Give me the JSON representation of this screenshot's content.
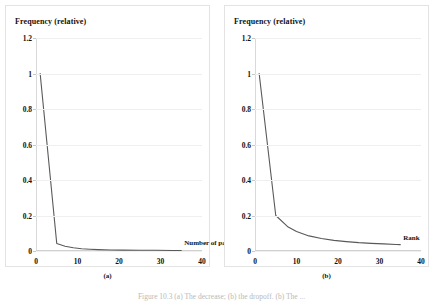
{
  "figure": {
    "caption": "Figure 10.3 (a) The decrease; (b) the dropoff. (b) The ...",
    "subcaption_a": "(a)",
    "subcaption_b": "(b)"
  },
  "chart_data": [
    {
      "type": "line",
      "panel": "a",
      "title": "Frequency (relative)",
      "xlabel": "Number of papers",
      "ylabel": "",
      "xlim": [
        0,
        40
      ],
      "ylim": [
        0,
        1.2
      ],
      "grid": true,
      "legend": "none",
      "xticks": [
        "0",
        "10",
        "20",
        "30",
        "40"
      ],
      "xtick_values": [
        0,
        10,
        20,
        30,
        40
      ],
      "yticks": [
        "0",
        "0.2",
        "0.4",
        "0.6",
        "0.8",
        "1",
        "1.2"
      ],
      "ytick_values": [
        0,
        0.2,
        0.4,
        0.6,
        0.8,
        1,
        1.2
      ],
      "x": [
        1,
        5,
        7,
        9,
        11,
        13,
        15,
        18,
        21,
        25,
        29,
        33,
        35
      ],
      "values": [
        1.0,
        0.042,
        0.027,
        0.018,
        0.013,
        0.01,
        0.008,
        0.006,
        0.005,
        0.004,
        0.004,
        0.003,
        0.003
      ],
      "line_color": "#595959"
    },
    {
      "type": "line",
      "panel": "b",
      "title": "Frequency (relative)",
      "xlabel": "Rank",
      "ylabel": "",
      "xlim": [
        0,
        40
      ],
      "ylim": [
        0,
        1.2
      ],
      "grid": true,
      "legend": "none",
      "xticks": [
        "0",
        "10",
        "20",
        "30",
        "40"
      ],
      "xtick_values": [
        0,
        10,
        20,
        30,
        40
      ],
      "yticks": [
        "0",
        "0.2",
        "0.4",
        "0.6",
        "0.8",
        "1",
        "1.2"
      ],
      "ytick_values": [
        0,
        0.2,
        0.4,
        0.6,
        0.8,
        1,
        1.2
      ],
      "x": [
        1,
        5,
        8,
        10,
        13,
        16,
        19,
        22,
        25,
        28,
        31,
        34,
        35
      ],
      "values": [
        1.0,
        0.2,
        0.135,
        0.11,
        0.085,
        0.07,
        0.06,
        0.053,
        0.047,
        0.043,
        0.04,
        0.037,
        0.036
      ],
      "line_color": "#595959"
    }
  ]
}
